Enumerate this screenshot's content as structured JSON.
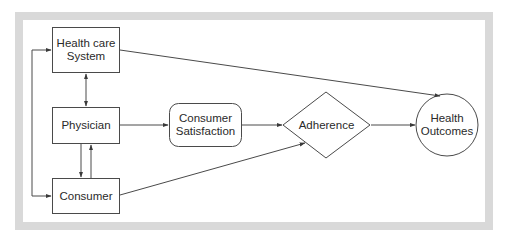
{
  "diagram": {
    "type": "flowchart",
    "colors": {
      "frame": "#d9d9d9",
      "stroke": "#4a4a4a",
      "text": "#2a2a2a",
      "background": "#ffffff"
    },
    "nodes": {
      "health_care_system": {
        "shape": "rectangle",
        "line1": "Health care",
        "line2": "System"
      },
      "physician": {
        "shape": "rectangle",
        "line1": "Physician"
      },
      "consumer": {
        "shape": "rectangle",
        "line1": "Consumer"
      },
      "consumer_satisfaction": {
        "shape": "rounded-rectangle",
        "line1": "Consumer",
        "line2": "Satisfaction"
      },
      "adherence": {
        "shape": "diamond",
        "line1": "Adherence"
      },
      "health_outcomes": {
        "shape": "circle",
        "line1": "Health",
        "line2": "Outcomes"
      }
    },
    "edges": [
      {
        "from": "Health care System",
        "to": "Physician",
        "direction": "bidirectional"
      },
      {
        "from": "Physician",
        "to": "Consumer",
        "direction": "forward"
      },
      {
        "from": "Consumer",
        "to": "Physician",
        "direction": "forward"
      },
      {
        "from": "Consumer",
        "to": "Health care System",
        "direction": "forward",
        "route": "left-loop"
      },
      {
        "from": "Health care System",
        "to": "Consumer",
        "direction": "forward",
        "route": "left-loop"
      },
      {
        "from": "Physician",
        "to": "Consumer Satisfaction",
        "direction": "forward"
      },
      {
        "from": "Consumer Satisfaction",
        "to": "Adherence",
        "direction": "forward"
      },
      {
        "from": "Consumer",
        "to": "Adherence",
        "direction": "forward"
      },
      {
        "from": "Adherence",
        "to": "Health Outcomes",
        "direction": "forward"
      },
      {
        "from": "Health care System",
        "to": "Health Outcomes",
        "direction": "forward"
      }
    ]
  }
}
